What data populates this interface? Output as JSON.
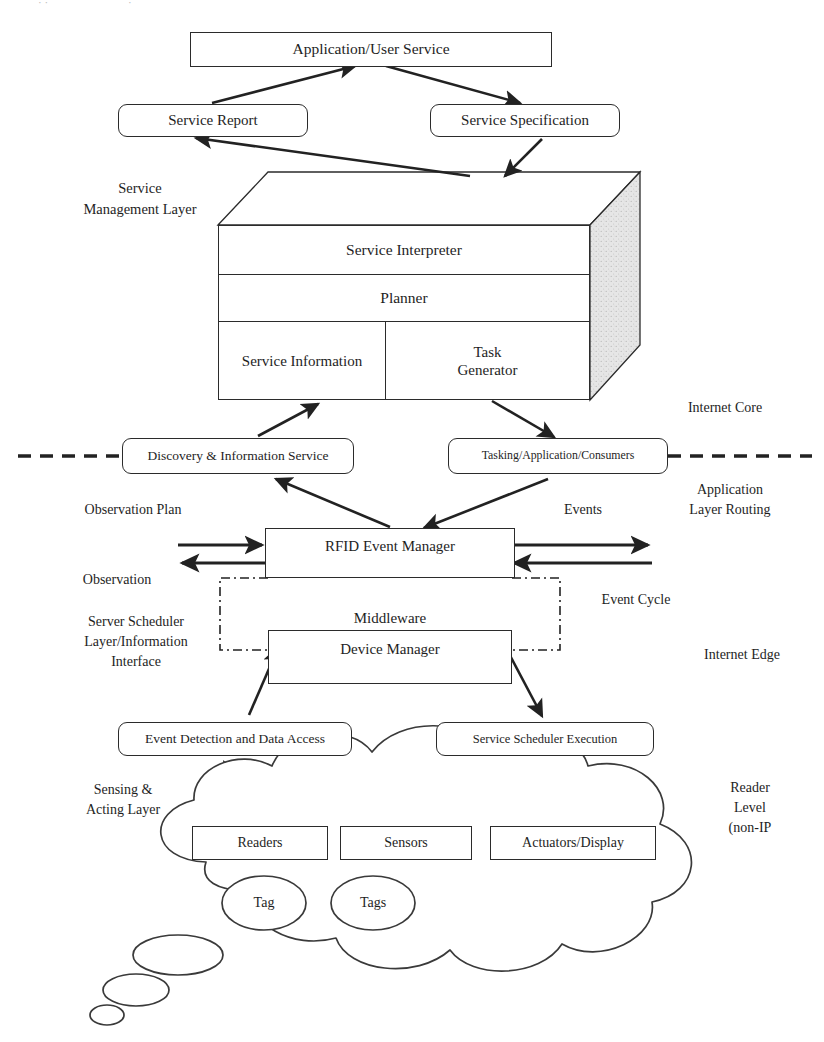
{
  "diagram": {
    "stroke_color": "#2b2b2b",
    "fill_color": "#ffffff",
    "shade_color": "#e2e2e2",
    "text_color": "#1e1e1e"
  },
  "nodes": {
    "application_user_service": "Application/User Service",
    "service_report": "Service Report",
    "service_specification": "Service Specification",
    "service_interpreter": "Service Interpreter",
    "planner": "Planner",
    "service_information": "Service Information",
    "task_generator": "Task\nGenerator",
    "discovery_information_service": "Discovery & Information Service",
    "tasking_application_consumers": "Tasking/Application/Consumers",
    "rfid_event_manager": "RFID Event Manager",
    "middleware": "Middleware",
    "device_manager": "Device Manager",
    "event_detection_data_access": "Event Detection and Data Access",
    "service_scheduler_execution": "Service Scheduler Execution",
    "readers": "Readers",
    "sensors": "Sensors",
    "actuators_display": "Actuators/Display",
    "tag": "Tag",
    "tags": "Tags"
  },
  "left_labels": {
    "service_management_layer": "Service\nManagement  Layer",
    "observation_plan": "Observation Plan",
    "observation": "Observation",
    "server_scheduler_layer": "Server Scheduler\nLayer/Information\nInterface",
    "sensing_acting_layer": "Sensing &\nActing  Layer"
  },
  "right_labels": {
    "internet_core": "Internet Core",
    "events": "Events",
    "application_layer_routing": "Application\nLayer Routing",
    "event_cycle": "Event Cycle",
    "internet_edge": "Internet Edge",
    "reader_level": "Reader\nLevel\n(non-IP"
  }
}
